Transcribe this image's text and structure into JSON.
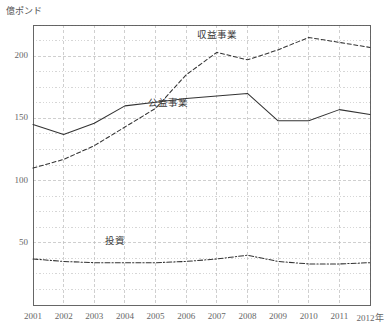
{
  "chart_data": {
    "type": "line",
    "title": "",
    "xlabel": "",
    "ylabel": "億ポンド",
    "x_unit_suffix": "年",
    "categories": [
      "2001",
      "2002",
      "2003",
      "2004",
      "2005",
      "2006",
      "2007",
      "2008",
      "2009",
      "2010",
      "2011",
      "2012"
    ],
    "x_tick_labels": [
      "2001",
      "2002",
      "2003",
      "2004",
      "2005",
      "2006",
      "2007",
      "2008",
      "2009",
      "2010",
      "2011",
      "2012年"
    ],
    "y_tick_labels": [
      "50",
      "100",
      "150",
      "200"
    ],
    "y_ticks": [
      50,
      100,
      150,
      200
    ],
    "ylim": [
      0,
      225
    ],
    "xlim": [
      2001,
      2012
    ],
    "grid": true,
    "legend": "inline-annotations",
    "series": [
      {
        "name": "収益事業",
        "style": "dashed",
        "color": "#333333",
        "label_x": 2007,
        "label_y": 218,
        "values": [
          110,
          117,
          128,
          143,
          158,
          185,
          203,
          197,
          205,
          215,
          211,
          207
        ]
      },
      {
        "name": "公益事業",
        "style": "solid",
        "color": "#333333",
        "label_x": 2005.4,
        "label_y": 163,
        "values": [
          145,
          137,
          146,
          160,
          163,
          166,
          168,
          170,
          148,
          148,
          157,
          153
        ]
      },
      {
        "name": "投資",
        "style": "dash-dot",
        "color": "#333333",
        "label_x": 2004,
        "label_y": 52,
        "values": [
          37,
          35,
          34,
          34,
          34,
          35,
          37,
          40,
          35,
          33,
          33,
          34
        ]
      }
    ]
  },
  "axes": {
    "plot_left": 33,
    "plot_right": 370,
    "plot_top": 25,
    "plot_bottom": 305,
    "frame_color": "#555555",
    "grid_color": "#bbbbbb"
  }
}
